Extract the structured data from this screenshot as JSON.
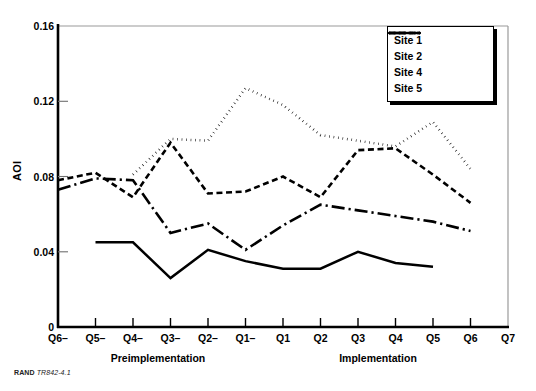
{
  "figure": {
    "footnote_prefix": "RAND",
    "footnote_id": "TR842-4.1"
  },
  "axes": {
    "ylabel": "AOI",
    "yticks": [
      "0",
      "0.04",
      "0.08",
      "0.12",
      "0.16"
    ],
    "xticks": [
      "Q6–",
      "Q5–",
      "Q4–",
      "Q3–",
      "Q2–",
      "Q1–",
      "Q1",
      "Q2",
      "Q3",
      "Q4",
      "Q5",
      "Q6",
      "Q7"
    ],
    "period_left": "Preimplementation",
    "period_right": "Implementation"
  },
  "legend": {
    "items": [
      {
        "label": "Site 1",
        "style": "solid"
      },
      {
        "label": "Site 2",
        "style": "dotted"
      },
      {
        "label": "Site 4",
        "style": "dashed"
      },
      {
        "label": "Site 5",
        "style": "dash-dot"
      }
    ]
  },
  "chart_data": {
    "type": "line",
    "title": "",
    "xlabel": "",
    "ylabel": "AOI",
    "categories": [
      "Q6–",
      "Q5–",
      "Q4–",
      "Q3–",
      "Q2–",
      "Q1–",
      "Q1",
      "Q2",
      "Q3",
      "Q4",
      "Q5",
      "Q6",
      "Q7"
    ],
    "ylim": [
      0,
      0.16
    ],
    "yticks": [
      0,
      0.04,
      0.08,
      0.12,
      0.16
    ],
    "grid": false,
    "legend_position": "top-right",
    "series": [
      {
        "name": "Site 1",
        "style": "solid",
        "color": "#000000",
        "x": [
          "Q5–",
          "Q4–",
          "Q3–",
          "Q2–",
          "Q1–",
          "Q1",
          "Q2",
          "Q3",
          "Q4",
          "Q5"
        ],
        "values": [
          0.045,
          0.045,
          0.026,
          0.041,
          0.035,
          0.031,
          0.031,
          0.04,
          0.034,
          0.032
        ]
      },
      {
        "name": "Site 2",
        "style": "dotted",
        "color": "#000000",
        "x": [
          "Q4–",
          "Q3–",
          "Q2–",
          "Q1–",
          "Q1",
          "Q2",
          "Q3",
          "Q4",
          "Q5",
          "Q6"
        ],
        "values": [
          0.081,
          0.1,
          0.099,
          0.127,
          0.118,
          0.102,
          0.099,
          0.096,
          0.109,
          0.084
        ]
      },
      {
        "name": "Site 4",
        "style": "dashed",
        "color": "#000000",
        "x": [
          "Q6–",
          "Q5–",
          "Q4–",
          "Q3–",
          "Q2–",
          "Q1–",
          "Q1",
          "Q2",
          "Q3",
          "Q4",
          "Q5",
          "Q6"
        ],
        "values": [
          0.078,
          0.082,
          0.069,
          0.098,
          0.071,
          0.072,
          0.08,
          0.069,
          0.094,
          0.095,
          0.081,
          0.066
        ]
      },
      {
        "name": "Site 5",
        "style": "dash-dot",
        "color": "#000000",
        "x": [
          "Q6–",
          "Q5–",
          "Q4–",
          "Q3–",
          "Q2–",
          "Q1–",
          "Q1",
          "Q2",
          "Q3",
          "Q4",
          "Q5",
          "Q6"
        ],
        "values": [
          0.073,
          0.079,
          0.078,
          0.05,
          0.055,
          0.041,
          0.054,
          0.065,
          0.062,
          0.059,
          0.056,
          0.051
        ]
      }
    ]
  }
}
